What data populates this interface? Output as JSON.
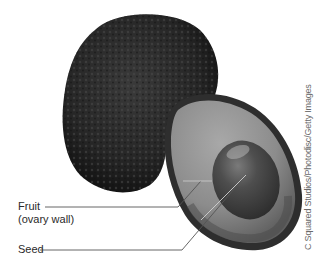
{
  "figure": {
    "labels": [
      {
        "id": "fruit",
        "line1": "Fruit",
        "line2": "(ovary wall)"
      },
      {
        "id": "seed",
        "line1": "Seed"
      }
    ],
    "credit": "C Squared Studios/Photodisc/Getty Images"
  },
  "colors": {
    "background": "#ffffff",
    "whole_avocado_skin": "#2b2b2b",
    "flesh": "#8a8a8a",
    "rim": "#3a3a3a",
    "seed": "#4a4a4a",
    "leader_line": "#555555",
    "label_text": "#2a2a2a"
  }
}
